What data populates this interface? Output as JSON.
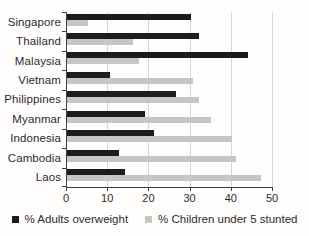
{
  "chart_data": {
    "type": "bar",
    "orientation": "horizontal",
    "title": "",
    "xlabel": "",
    "ylabel": "",
    "categories": [
      "Singapore",
      "Thailand",
      "Malaysia",
      "Vietnam",
      "Philippines",
      "Myanmar",
      "Indonesia",
      "Cambodia",
      "Laos"
    ],
    "series": [
      {
        "name": "% Adults overweight",
        "color": "#1e1b1c",
        "values": [
          30,
          32,
          44,
          10.5,
          26.5,
          19,
          21,
          12.5,
          14
        ]
      },
      {
        "name": "% Children under 5 stunted",
        "color": "#c6c6c5",
        "values": [
          5,
          16,
          17.5,
          30.5,
          32,
          35,
          40,
          41,
          47
        ]
      }
    ],
    "x_axis": {
      "min": 0,
      "max": 50,
      "ticks": [
        0,
        10,
        20,
        30,
        40,
        50
      ]
    },
    "grid": "vertical-gridlines",
    "legend_position": "bottom"
  },
  "colors": {
    "axis": "#413e3f",
    "gridline": "#d5d5d4",
    "text": "#2c2a2b",
    "background": "#fffefd"
  }
}
